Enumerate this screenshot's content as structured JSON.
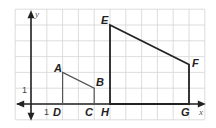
{
  "figure": {
    "type": "coordinate-grid",
    "grid": {
      "unit_px": 15.8,
      "origin_px": [
        31,
        104
      ],
      "x_range": [
        -1,
        11
      ],
      "y_range": [
        -1,
        6
      ],
      "line_color": "#d4d4d4",
      "border_color": "#c8c8c8"
    },
    "axes": {
      "x_label": "x",
      "y_label": "y",
      "color": "#222222",
      "tick_labels": {
        "x_one": "1",
        "y_one": "1"
      }
    },
    "polygons": [
      {
        "name": "ABCD",
        "color": "#555555",
        "vertices": [
          {
            "label": "A",
            "x": 2,
            "y": 2
          },
          {
            "label": "B",
            "x": 4,
            "y": 1
          },
          {
            "label": "C",
            "x": 4,
            "y": 0
          },
          {
            "label": "D",
            "x": 2,
            "y": 0
          }
        ]
      },
      {
        "name": "EFGH",
        "color": "#222222",
        "vertices": [
          {
            "label": "E",
            "x": 5,
            "y": 5
          },
          {
            "label": "F",
            "x": 10,
            "y": 2.5
          },
          {
            "label": "G",
            "x": 10,
            "y": 0
          },
          {
            "label": "H",
            "x": 5,
            "y": 0
          }
        ]
      }
    ],
    "labels": {
      "A": "A",
      "B": "B",
      "C": "C",
      "D": "D",
      "E": "E",
      "F": "F",
      "G": "G",
      "H": "H"
    }
  }
}
